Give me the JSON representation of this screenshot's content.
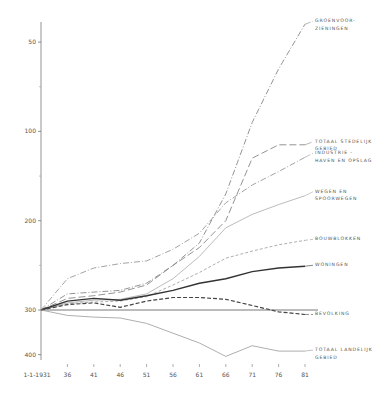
{
  "chart_data": {
    "type": "line",
    "title": "",
    "xlabel": "",
    "ylabel": "",
    "x": [
      "1-1-1931",
      "36",
      "41",
      "46",
      "51",
      "56",
      "61",
      "66",
      "71",
      "76",
      "81"
    ],
    "y_ticks": [
      50,
      100,
      200,
      300,
      400
    ],
    "y_minor_ticks": [
      150,
      250,
      350
    ],
    "ylim": [
      40,
      430
    ],
    "grid": false,
    "legend_position": "inline-right",
    "series": [
      {
        "name": "GROENVOORZIENINGEN",
        "label_lines": [
          "GROENVOOR-",
          "ZIENINGEN"
        ],
        "style": "dashdot",
        "color": "#888888",
        "width": 0.9,
        "values": [
          100,
          118,
          120,
          122,
          130,
          150,
          175,
          230,
          310,
          370,
          420
        ]
      },
      {
        "name": "TOTAAL STEDELIJK GEBIED",
        "label_lines": [
          "TOTAAL STEDELIJK",
          "GEBIED"
        ],
        "style": "longdash",
        "color": "#888888",
        "width": 0.9,
        "values": [
          100,
          113,
          116,
          120,
          128,
          150,
          170,
          200,
          270,
          285,
          285
        ]
      },
      {
        "name": "INDUSTRIE - HAVEN EN OPSLAG",
        "label_lines": [
          "INDUSTRIE -",
          "HAVEN EN OPSLAG"
        ],
        "style": "dashdot",
        "color": "#999999",
        "width": 0.9,
        "values": [
          100,
          135,
          147,
          152,
          155,
          168,
          186,
          220,
          240,
          255,
          271
        ]
      },
      {
        "name": "WEGEN EN SPOORWEGEN",
        "label_lines": [
          "WEGEN EN",
          "SPOORWEGEN"
        ],
        "style": "solid",
        "color": "#aaaaaa",
        "width": 0.8,
        "values": [
          100,
          108,
          111,
          112,
          118,
          135,
          160,
          192,
          207,
          218,
          228
        ]
      },
      {
        "name": "BOUWBLOKKEN",
        "label_lines": [
          "BOUWBLOKKEN"
        ],
        "style": "dashed",
        "color": "#999999",
        "width": 0.8,
        "values": [
          100,
          107,
          109,
          110,
          115,
          128,
          142,
          158,
          166,
          173,
          178
        ]
      },
      {
        "name": "WONINGEN",
        "label_lines": [
          "WONINGEN"
        ],
        "style": "solid",
        "color": "#333333",
        "width": 1.4,
        "values": [
          100,
          110,
          113,
          111,
          116,
          122,
          130,
          135,
          143,
          147,
          149
        ]
      },
      {
        "name": "BEVOLKING",
        "label_lines": [
          "BEVOLKING"
        ],
        "style": "dashed-bold",
        "color": "#444444",
        "width": 1.2,
        "values": [
          100,
          106,
          108,
          103,
          110,
          114,
          114,
          112,
          105,
          98,
          95
        ]
      },
      {
        "name": "BASELINE 100",
        "label_lines": [],
        "style": "solid",
        "color": "#555555",
        "width": 0.8,
        "values": [
          100,
          100,
          100,
          100,
          100,
          100,
          100,
          100,
          100,
          100,
          100
        ]
      },
      {
        "name": "TOTAAL LANDELIJK GEBIED",
        "label_lines": [
          "TOTAAL LANDELIJK",
          "GEBIED"
        ],
        "style": "solid",
        "color": "#999999",
        "width": 0.8,
        "values": [
          100,
          94,
          92,
          91,
          85,
          74,
          63,
          48,
          60,
          54,
          54
        ]
      }
    ]
  },
  "axis": {
    "y_labels": [
      "400",
      "300",
      "200",
      "100",
      "50"
    ],
    "x_labels": [
      "1-1-1931",
      "36",
      "41",
      "46",
      "51",
      "56",
      "61",
      "66",
      "71",
      "76",
      "81"
    ]
  }
}
